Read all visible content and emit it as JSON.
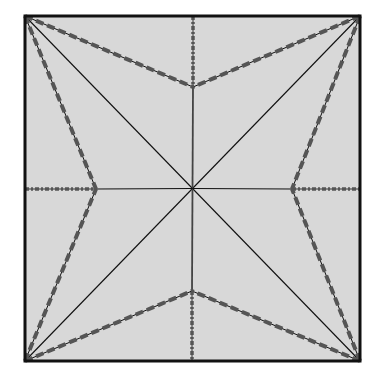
{
  "diagram": {
    "type": "origami-crease-pattern",
    "paper": {
      "x": 25,
      "y": 16,
      "width": 335,
      "height": 345,
      "fill": "#d8d8d8",
      "border": "#111111"
    },
    "center": [
      192.5,
      188.5
    ],
    "colors": {
      "line": "#111111",
      "crease_overlay": "#555555",
      "paper": "#d8d8d8"
    },
    "star_points": {
      "top": [
        193,
        87
      ],
      "right": [
        292,
        189
      ],
      "bottom": [
        192,
        291
      ],
      "left": [
        96,
        189
      ]
    },
    "corners": {
      "top_left": [
        25,
        16
      ],
      "top_right": [
        360,
        16
      ],
      "bottom_right": [
        360,
        361
      ],
      "bottom_left": [
        25,
        361
      ]
    },
    "lines": [
      {
        "id": "diag-tl-br",
        "from": [
          25,
          16
        ],
        "to": [
          360,
          361
        ],
        "style": "solid-thin"
      },
      {
        "id": "diag-tr-bl",
        "from": [
          360,
          16
        ],
        "to": [
          25,
          361
        ],
        "style": "solid-thin"
      },
      {
        "id": "center-up",
        "from": [
          192.5,
          188.5
        ],
        "to": [
          193,
          87
        ],
        "style": "solid-gray"
      },
      {
        "id": "center-down",
        "from": [
          192.5,
          188.5
        ],
        "to": [
          192,
          291
        ],
        "style": "solid-gray"
      },
      {
        "id": "center-left",
        "from": [
          192.5,
          188.5
        ],
        "to": [
          96,
          189
        ],
        "style": "solid-thin"
      },
      {
        "id": "center-right",
        "from": [
          192.5,
          188.5
        ],
        "to": [
          292,
          189
        ],
        "style": "solid-thin"
      },
      {
        "id": "top-edge-to-top-point",
        "from": [
          193,
          16
        ],
        "to": [
          193,
          87
        ],
        "style": "dash-dot"
      },
      {
        "id": "bottom-point-to-bottom-edge",
        "from": [
          192,
          291
        ],
        "to": [
          192,
          361
        ],
        "style": "dash-dot"
      },
      {
        "id": "left-edge-to-left-point",
        "from": [
          25,
          189
        ],
        "to": [
          96,
          189
        ],
        "style": "dash-dot"
      },
      {
        "id": "right-point-to-right-edge",
        "from": [
          292,
          189
        ],
        "to": [
          360,
          189
        ],
        "style": "dash-dot"
      },
      {
        "id": "tl-to-top-point",
        "from": [
          25,
          16
        ],
        "to": [
          193,
          87
        ],
        "style": "dashed"
      },
      {
        "id": "tr-to-top-point",
        "from": [
          360,
          16
        ],
        "to": [
          193,
          87
        ],
        "style": "dashed"
      },
      {
        "id": "tr-to-right-point",
        "from": [
          360,
          16
        ],
        "to": [
          292,
          189
        ],
        "style": "dashed"
      },
      {
        "id": "br-to-right-point",
        "from": [
          360,
          361
        ],
        "to": [
          292,
          189
        ],
        "style": "dashed"
      },
      {
        "id": "br-to-bottom-point",
        "from": [
          360,
          361
        ],
        "to": [
          192,
          291
        ],
        "style": "dashed"
      },
      {
        "id": "bl-to-bottom-point",
        "from": [
          25,
          361
        ],
        "to": [
          192,
          291
        ],
        "style": "dashed"
      },
      {
        "id": "bl-to-left-point",
        "from": [
          25,
          361
        ],
        "to": [
          96,
          189
        ],
        "style": "dashed"
      },
      {
        "id": "tl-to-left-point",
        "from": [
          25,
          16
        ],
        "to": [
          96,
          189
        ],
        "style": "dashed"
      }
    ]
  }
}
